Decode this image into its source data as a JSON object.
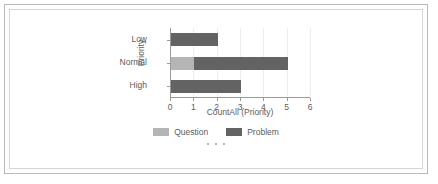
{
  "chart_data": {
    "type": "bar",
    "orientation": "horizontal",
    "stacked": true,
    "title": "",
    "xlabel": "CountAll (Priority)",
    "ylabel": "Priority",
    "categories": [
      "Low",
      "Normal",
      "High"
    ],
    "series": [
      {
        "name": "Question",
        "color": "#b5b5b5",
        "values": [
          0,
          1,
          0
        ]
      },
      {
        "name": "Problem",
        "color": "#636363",
        "values": [
          2,
          4,
          3
        ]
      }
    ],
    "totals": [
      2,
      5,
      3
    ],
    "xlim": [
      0,
      6
    ],
    "xticks": [
      0,
      1,
      2,
      3,
      4,
      5,
      6
    ],
    "xtick_labels": [
      "0",
      "1",
      "2",
      "3",
      "4",
      "5",
      "6"
    ],
    "grid": true,
    "grid_axis": "x",
    "legend": {
      "position": "bottom-center",
      "entries": [
        {
          "label": "Question",
          "color": "#b5b5b5"
        },
        {
          "label": "Problem",
          "color": "#636363"
        }
      ]
    },
    "overflow_indicator": "• • •"
  },
  "colors": {
    "question": "#b5b5b5",
    "problem": "#636363",
    "axis": "#9a9a9a",
    "grid": "#ededed",
    "text": "#5c5c5c",
    "frame_outer": "#b9b9b9",
    "frame_inner": "#d6d6d6",
    "background": "#ffffff"
  }
}
